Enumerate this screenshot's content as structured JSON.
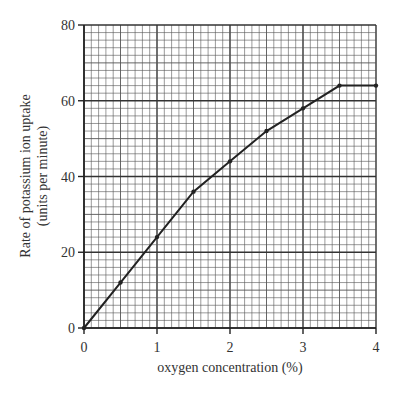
{
  "chart_data": {
    "type": "line",
    "title": "",
    "xlabel": "oxygen concentration (%)",
    "ylabel": "Rate of potassium ion uptake",
    "ylabel_units": "(units per minute)",
    "x": [
      0,
      0.5,
      1,
      1.5,
      2,
      2.5,
      3,
      3.5,
      4
    ],
    "series": [
      {
        "name": "uptake",
        "values": [
          0,
          12,
          24,
          36,
          44,
          52,
          58,
          64,
          64
        ]
      }
    ],
    "xlim": [
      0,
      4
    ],
    "ylim": [
      0,
      80
    ],
    "x_ticks": [
      "0",
      "1",
      "2",
      "3",
      "4"
    ],
    "y_ticks": [
      "0",
      "20",
      "40",
      "60",
      "80"
    ],
    "grid": true,
    "legend": "none"
  }
}
